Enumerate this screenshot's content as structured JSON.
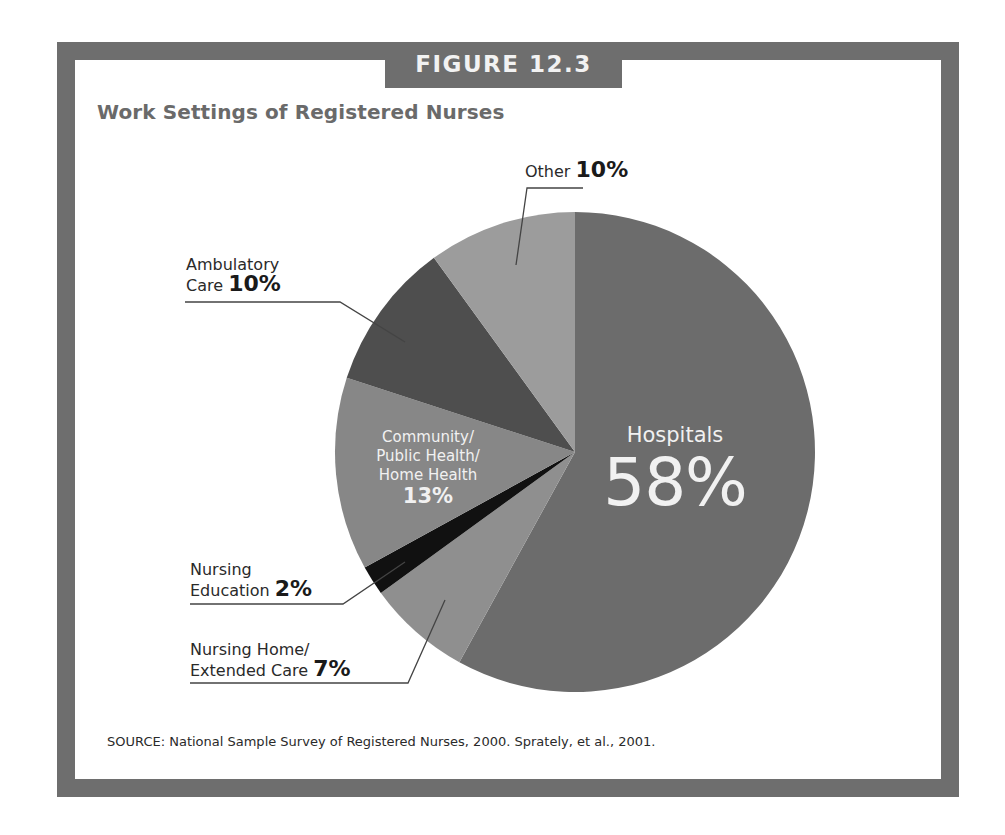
{
  "figure": {
    "label": "FIGURE 12.3",
    "title": "Work Settings of Registered Nurses",
    "source": "SOURCE: National Sample Survey of Registered Nurses, 2000. Sprately, et al., 2001."
  },
  "labels": {
    "other": {
      "name": "Other",
      "value": "10%"
    },
    "ambulatory": {
      "line1": "Ambulatory",
      "line2": "Care",
      "value": "10%"
    },
    "community": {
      "line1": "Community/",
      "line2": "Public Health/",
      "line3": "Home Health",
      "value": "13%"
    },
    "education": {
      "line1": "Nursing",
      "line2": "Education",
      "value": "2%"
    },
    "nursing_home": {
      "line1": "Nursing Home/",
      "line2": "Extended Care",
      "value": "7%"
    },
    "hospitals": {
      "name": "Hospitals",
      "value": "58%"
    }
  },
  "colors": {
    "frame": "#6e6e6e",
    "hospitals": "#6c6c6c",
    "nursing_home": "#8f8f8f",
    "education": "#111111",
    "community": "#878787",
    "ambulatory": "#4e4e4e",
    "other": "#9c9c9c"
  },
  "chart_data": {
    "type": "pie",
    "title": "Work Settings of Registered Nurses",
    "subtitle": "FIGURE 12.3",
    "categories": [
      "Hospitals",
      "Nursing Home/Extended Care",
      "Nursing Education",
      "Community/Public Health/Home Health",
      "Ambulatory Care",
      "Other"
    ],
    "values": [
      58,
      7,
      2,
      13,
      10,
      10
    ],
    "unit": "%",
    "start_angle": "12 o'clock, clockwise",
    "legend": "none (direct labels with leader lines)",
    "source": "SOURCE: National Sample Survey of Registered Nurses, 2000. Sprately, et al., 2001."
  }
}
